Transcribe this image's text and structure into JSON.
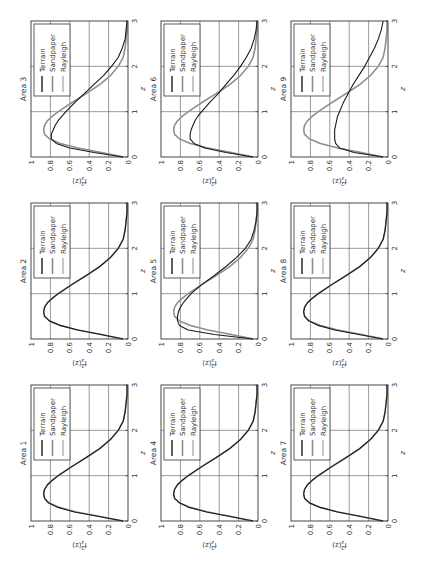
{
  "chart_data": {
    "type": "line",
    "layout": "3x3 grid of small multiples, page rotated 90 degrees counter-clockwise",
    "xlabel": "z",
    "ylabel": "f_z^2(z)",
    "xlim": [
      0,
      3
    ],
    "ylim": [
      0,
      1
    ],
    "xticks": [
      "0",
      "1",
      "2",
      "3"
    ],
    "yticks": [
      "0",
      "0.2",
      "0.4",
      "0.6",
      "0.8",
      "1"
    ],
    "grid": true,
    "legend_position": "top-right",
    "legend": [
      "Terrain",
      "Sandpaper",
      "Rayleigh"
    ],
    "series_colors": {
      "Terrain": "#1a1a1a",
      "Sandpaper": "#8c8c8c",
      "Rayleigh": "#c4c4c4"
    },
    "x": [
      0,
      0.1,
      0.2,
      0.3,
      0.4,
      0.5,
      0.6,
      0.7,
      0.8,
      0.9,
      1.0,
      1.2,
      1.4,
      1.6,
      1.8,
      2.0,
      2.2,
      2.4,
      2.6,
      2.8,
      3.0
    ],
    "panels": [
      {
        "title": "Area 1",
        "series": [
          {
            "name": "Terrain",
            "values": [
              0.05,
              0.3,
              0.55,
              0.72,
              0.82,
              0.86,
              0.87,
              0.86,
              0.83,
              0.78,
              0.72,
              0.58,
              0.43,
              0.29,
              0.18,
              0.1,
              0.05,
              0.03,
              0.02,
              0.01,
              0.01
            ]
          },
          {
            "name": "Sandpaper",
            "values": [
              0.05,
              0.3,
              0.55,
              0.72,
              0.82,
              0.86,
              0.87,
              0.86,
              0.83,
              0.78,
              0.72,
              0.58,
              0.43,
              0.29,
              0.18,
              0.1,
              0.05,
              0.03,
              0.02,
              0.01,
              0.01
            ]
          },
          {
            "name": "Rayleigh",
            "values": [
              0.05,
              0.28,
              0.52,
              0.7,
              0.81,
              0.86,
              0.87,
              0.86,
              0.83,
              0.78,
              0.72,
              0.58,
              0.43,
              0.29,
              0.18,
              0.1,
              0.05,
              0.03,
              0.02,
              0.01,
              0.01
            ]
          }
        ]
      },
      {
        "title": "Area 2",
        "series": [
          {
            "name": "Terrain",
            "values": [
              0.05,
              0.28,
              0.52,
              0.7,
              0.81,
              0.86,
              0.87,
              0.86,
              0.83,
              0.78,
              0.72,
              0.58,
              0.43,
              0.29,
              0.18,
              0.1,
              0.05,
              0.03,
              0.02,
              0.01,
              0.01
            ]
          },
          {
            "name": "Sandpaper",
            "values": [
              0.05,
              0.28,
              0.52,
              0.7,
              0.81,
              0.86,
              0.87,
              0.86,
              0.83,
              0.78,
              0.72,
              0.58,
              0.43,
              0.29,
              0.18,
              0.1,
              0.05,
              0.03,
              0.02,
              0.01,
              0.01
            ]
          },
          {
            "name": "Rayleigh",
            "values": [
              0.05,
              0.28,
              0.52,
              0.7,
              0.81,
              0.86,
              0.87,
              0.86,
              0.83,
              0.78,
              0.72,
              0.58,
              0.43,
              0.29,
              0.18,
              0.1,
              0.05,
              0.03,
              0.02,
              0.01,
              0.01
            ]
          }
        ]
      },
      {
        "title": "Area 3",
        "series": [
          {
            "name": "Terrain",
            "values": [
              0.05,
              0.35,
              0.6,
              0.74,
              0.79,
              0.79,
              0.77,
              0.75,
              0.72,
              0.68,
              0.64,
              0.55,
              0.45,
              0.35,
              0.25,
              0.17,
              0.1,
              0.06,
              0.03,
              0.02,
              0.01
            ]
          },
          {
            "name": "Sandpaper",
            "values": [
              0.05,
              0.28,
              0.52,
              0.7,
              0.81,
              0.86,
              0.87,
              0.86,
              0.83,
              0.78,
              0.72,
              0.58,
              0.43,
              0.29,
              0.18,
              0.1,
              0.05,
              0.03,
              0.02,
              0.01,
              0.01
            ]
          },
          {
            "name": "Rayleigh",
            "values": [
              0.05,
              0.28,
              0.52,
              0.7,
              0.81,
              0.86,
              0.87,
              0.86,
              0.83,
              0.78,
              0.72,
              0.58,
              0.43,
              0.29,
              0.18,
              0.1,
              0.05,
              0.03,
              0.02,
              0.01,
              0.01
            ]
          }
        ]
      },
      {
        "title": "Area 4",
        "series": [
          {
            "name": "Terrain",
            "values": [
              0.05,
              0.29,
              0.53,
              0.71,
              0.81,
              0.86,
              0.87,
              0.86,
              0.83,
              0.78,
              0.72,
              0.58,
              0.43,
              0.29,
              0.18,
              0.1,
              0.05,
              0.03,
              0.02,
              0.01,
              0.01
            ]
          },
          {
            "name": "Sandpaper",
            "values": [
              0.05,
              0.28,
              0.52,
              0.7,
              0.81,
              0.86,
              0.87,
              0.86,
              0.83,
              0.78,
              0.72,
              0.58,
              0.43,
              0.29,
              0.18,
              0.1,
              0.05,
              0.03,
              0.02,
              0.01,
              0.01
            ]
          },
          {
            "name": "Rayleigh",
            "values": [
              0.05,
              0.28,
              0.52,
              0.7,
              0.81,
              0.86,
              0.87,
              0.86,
              0.83,
              0.78,
              0.72,
              0.58,
              0.43,
              0.29,
              0.18,
              0.1,
              0.05,
              0.03,
              0.02,
              0.01,
              0.01
            ]
          }
        ]
      },
      {
        "title": "Area 5",
        "series": [
          {
            "name": "Terrain",
            "values": [
              0.05,
              0.45,
              0.72,
              0.81,
              0.83,
              0.83,
              0.82,
              0.8,
              0.77,
              0.73,
              0.69,
              0.58,
              0.45,
              0.33,
              0.22,
              0.13,
              0.07,
              0.04,
              0.02,
              0.01,
              0.01
            ]
          },
          {
            "name": "Sandpaper",
            "values": [
              0.05,
              0.28,
              0.52,
              0.7,
              0.81,
              0.86,
              0.87,
              0.86,
              0.83,
              0.78,
              0.72,
              0.58,
              0.43,
              0.29,
              0.18,
              0.1,
              0.05,
              0.03,
              0.02,
              0.01,
              0.01
            ]
          },
          {
            "name": "Rayleigh",
            "values": [
              0.05,
              0.28,
              0.52,
              0.7,
              0.81,
              0.86,
              0.87,
              0.86,
              0.83,
              0.78,
              0.72,
              0.58,
              0.43,
              0.29,
              0.18,
              0.1,
              0.05,
              0.03,
              0.02,
              0.01,
              0.01
            ]
          }
        ]
      },
      {
        "title": "Area 6",
        "series": [
          {
            "name": "Terrain",
            "values": [
              0.05,
              0.33,
              0.55,
              0.66,
              0.7,
              0.7,
              0.69,
              0.67,
              0.65,
              0.62,
              0.58,
              0.5,
              0.41,
              0.33,
              0.25,
              0.18,
              0.12,
              0.07,
              0.04,
              0.02,
              0.01
            ]
          },
          {
            "name": "Sandpaper",
            "values": [
              0.05,
              0.28,
              0.52,
              0.7,
              0.81,
              0.86,
              0.87,
              0.86,
              0.83,
              0.78,
              0.72,
              0.58,
              0.43,
              0.29,
              0.18,
              0.1,
              0.05,
              0.03,
              0.02,
              0.01,
              0.01
            ]
          },
          {
            "name": "Rayleigh",
            "values": [
              0.05,
              0.28,
              0.52,
              0.7,
              0.81,
              0.86,
              0.87,
              0.86,
              0.83,
              0.78,
              0.72,
              0.58,
              0.43,
              0.29,
              0.18,
              0.1,
              0.05,
              0.03,
              0.02,
              0.01,
              0.01
            ]
          }
        ]
      },
      {
        "title": "Area 7",
        "series": [
          {
            "name": "Terrain",
            "values": [
              0.05,
              0.28,
              0.52,
              0.7,
              0.81,
              0.86,
              0.87,
              0.86,
              0.83,
              0.78,
              0.72,
              0.58,
              0.43,
              0.29,
              0.18,
              0.1,
              0.05,
              0.03,
              0.02,
              0.01,
              0.01
            ]
          },
          {
            "name": "Sandpaper",
            "values": [
              0.05,
              0.28,
              0.52,
              0.7,
              0.81,
              0.86,
              0.87,
              0.86,
              0.83,
              0.78,
              0.72,
              0.58,
              0.43,
              0.29,
              0.18,
              0.1,
              0.05,
              0.03,
              0.02,
              0.01,
              0.01
            ]
          },
          {
            "name": "Rayleigh",
            "values": [
              0.05,
              0.28,
              0.52,
              0.7,
              0.81,
              0.86,
              0.87,
              0.86,
              0.83,
              0.78,
              0.72,
              0.58,
              0.43,
              0.29,
              0.18,
              0.1,
              0.05,
              0.03,
              0.02,
              0.01,
              0.01
            ]
          }
        ]
      },
      {
        "title": "Area 8",
        "series": [
          {
            "name": "Terrain",
            "values": [
              0.05,
              0.3,
              0.55,
              0.72,
              0.82,
              0.86,
              0.87,
              0.86,
              0.83,
              0.78,
              0.72,
              0.58,
              0.43,
              0.29,
              0.18,
              0.1,
              0.05,
              0.03,
              0.02,
              0.01,
              0.01
            ]
          },
          {
            "name": "Sandpaper",
            "values": [
              0.05,
              0.28,
              0.52,
              0.7,
              0.81,
              0.86,
              0.87,
              0.86,
              0.83,
              0.78,
              0.72,
              0.58,
              0.43,
              0.29,
              0.18,
              0.1,
              0.05,
              0.03,
              0.02,
              0.01,
              0.01
            ]
          },
          {
            "name": "Rayleigh",
            "values": [
              0.05,
              0.28,
              0.52,
              0.7,
              0.81,
              0.86,
              0.87,
              0.86,
              0.83,
              0.78,
              0.72,
              0.58,
              0.43,
              0.29,
              0.18,
              0.1,
              0.05,
              0.03,
              0.02,
              0.01,
              0.01
            ]
          }
        ]
      },
      {
        "title": "Area 9",
        "series": [
          {
            "name": "Terrain",
            "values": [
              0.05,
              0.35,
              0.5,
              0.54,
              0.55,
              0.55,
              0.55,
              0.54,
              0.53,
              0.52,
              0.5,
              0.46,
              0.41,
              0.36,
              0.3,
              0.24,
              0.19,
              0.14,
              0.1,
              0.07,
              0.05
            ]
          },
          {
            "name": "Sandpaper",
            "values": [
              0.05,
              0.28,
              0.52,
              0.7,
              0.81,
              0.86,
              0.87,
              0.86,
              0.83,
              0.78,
              0.72,
              0.58,
              0.43,
              0.29,
              0.18,
              0.1,
              0.05,
              0.03,
              0.02,
              0.01,
              0.01
            ]
          },
          {
            "name": "Rayleigh",
            "values": [
              0.05,
              0.28,
              0.52,
              0.7,
              0.81,
              0.86,
              0.87,
              0.86,
              0.83,
              0.78,
              0.72,
              0.58,
              0.43,
              0.29,
              0.18,
              0.1,
              0.05,
              0.03,
              0.02,
              0.01,
              0.01
            ]
          }
        ]
      }
    ]
  }
}
